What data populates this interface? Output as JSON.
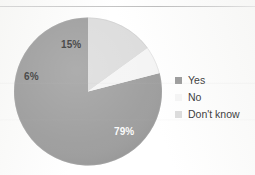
{
  "figure": {
    "background_color": "#ffffff",
    "rule_color": "#c9c9c9"
  },
  "chart_data": {
    "type": "pie",
    "title": "",
    "subtitle": "",
    "xlabel": "",
    "ylabel": "",
    "grid": false,
    "legend_position": "right",
    "start_angle_deg": 90,
    "direction": "counterclockwise",
    "categories": [
      "Yes",
      "No",
      "Don't know"
    ],
    "values": [
      79,
      6,
      15
    ],
    "value_unit": "%",
    "data_labels": [
      "79%",
      "6%",
      "15%"
    ],
    "colors": [
      "#9e9e9e",
      "#f4f4f4",
      "#dcdcdc"
    ],
    "slices": [
      {
        "label": "Yes",
        "value": 79,
        "data_label": "79%",
        "color": "#9e9e9e",
        "label_text_color": "#fbfbfb"
      },
      {
        "label": "No",
        "value": 6,
        "data_label": "6%",
        "color": "#f4f4f4",
        "label_text_color": "#4b4b4b"
      },
      {
        "label": "Don't know",
        "value": 15,
        "data_label": "15%",
        "color": "#dcdcdc",
        "label_text_color": "#4b4b4b"
      }
    ]
  },
  "legend": {
    "items": [
      {
        "label": "Yes",
        "color": "#9e9e9e"
      },
      {
        "label": "No",
        "color": "#f4f4f4"
      },
      {
        "label": "Don't know",
        "color": "#dcdcdc"
      }
    ]
  }
}
